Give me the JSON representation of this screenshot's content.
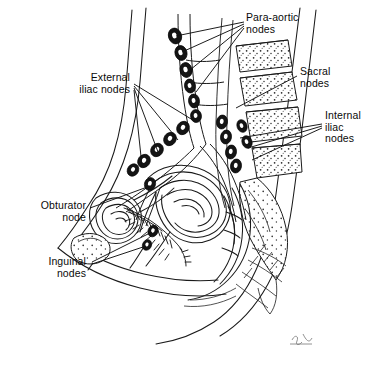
{
  "figure": {
    "type": "anatomical-line-diagram",
    "style": "black-and-white pen-and-ink medical illustration",
    "signature": "ST"
  },
  "labels": [
    {
      "id": "para-aortic",
      "text": "Para-aortic\nnodes",
      "align": "left",
      "x": 246,
      "y": 12,
      "leaders": [
        [
          244,
          22,
          176,
          36
        ],
        [
          244,
          24,
          182,
          52
        ],
        [
          244,
          26,
          190,
          70
        ],
        [
          244,
          28,
          196,
          92
        ]
      ]
    },
    {
      "id": "external-iliac",
      "text": "External\niliac nodes",
      "align": "right",
      "x": 24,
      "y": 72,
      "w": 106,
      "leaders": [
        [
          134,
          84,
          196,
          122
        ],
        [
          134,
          86,
          178,
          140
        ],
        [
          134,
          88,
          158,
          152
        ],
        [
          134,
          90,
          142,
          166
        ]
      ]
    },
    {
      "id": "sacral",
      "text": "Sacral\nnodes",
      "align": "left",
      "x": 300,
      "y": 66,
      "leaders": [
        [
          297,
          76,
          236,
          108
        ]
      ]
    },
    {
      "id": "internal-iliac",
      "text": "Internal\niliac\nnodes",
      "align": "left",
      "x": 325,
      "y": 110,
      "leaders": [
        [
          322,
          124,
          240,
          138
        ],
        [
          322,
          126,
          248,
          148
        ],
        [
          322,
          128,
          252,
          160
        ]
      ]
    },
    {
      "id": "obturator",
      "text": "Obturator\nnode",
      "align": "right",
      "x": 8,
      "y": 200,
      "w": 78,
      "leaders": [
        [
          90,
          208,
          150,
          186
        ]
      ]
    },
    {
      "id": "inguinal",
      "text": "Inguinal\nnodes",
      "align": "right",
      "x": 16,
      "y": 256,
      "w": 70,
      "leaders": [
        [
          92,
          262,
          152,
          232
        ],
        [
          92,
          264,
          146,
          246
        ]
      ]
    }
  ],
  "node_groups": [
    {
      "name": "para-aortic-chain",
      "nodes": [
        {
          "cx": 175,
          "cy": 36,
          "rx": 6.5,
          "ry": 8,
          "rot": -18
        },
        {
          "cx": 181,
          "cy": 53,
          "rx": 6,
          "ry": 7.5,
          "rot": -14
        },
        {
          "cx": 186,
          "cy": 70,
          "rx": 6,
          "ry": 7.5,
          "rot": -12
        },
        {
          "cx": 190,
          "cy": 86,
          "rx": 5.5,
          "ry": 7,
          "rot": -10
        },
        {
          "cx": 194,
          "cy": 101,
          "rx": 5.5,
          "ry": 7,
          "rot": -8
        },
        {
          "cx": 196,
          "cy": 116,
          "rx": 5.5,
          "ry": 6.5,
          "rot": -6
        }
      ]
    },
    {
      "name": "external-iliac-chain",
      "nodes": [
        {
          "cx": 183,
          "cy": 128,
          "rx": 6,
          "ry": 7,
          "rot": 35
        },
        {
          "cx": 170,
          "cy": 139,
          "rx": 6,
          "ry": 7,
          "rot": 35
        },
        {
          "cx": 157,
          "cy": 150,
          "rx": 6,
          "ry": 7,
          "rot": 35
        },
        {
          "cx": 144,
          "cy": 161,
          "rx": 6,
          "ry": 7,
          "rot": 35
        },
        {
          "cx": 133,
          "cy": 170,
          "rx": 5.5,
          "ry": 6.5,
          "rot": 35
        }
      ]
    },
    {
      "name": "internal-iliac-chain",
      "nodes": [
        {
          "cx": 222,
          "cy": 122,
          "rx": 5.5,
          "ry": 7,
          "rot": 10
        },
        {
          "cx": 226,
          "cy": 137,
          "rx": 5.5,
          "ry": 7,
          "rot": 10
        },
        {
          "cx": 231,
          "cy": 152,
          "rx": 5.5,
          "ry": 7,
          "rot": 10
        },
        {
          "cx": 236,
          "cy": 166,
          "rx": 5.5,
          "ry": 7,
          "rot": 10
        }
      ]
    },
    {
      "name": "sacral-internal-lateral",
      "nodes": [
        {
          "cx": 242,
          "cy": 126,
          "rx": 5,
          "ry": 6.5,
          "rot": -20
        },
        {
          "cx": 247,
          "cy": 142,
          "rx": 5,
          "ry": 6.5,
          "rot": -20
        }
      ]
    },
    {
      "name": "obturator-node",
      "nodes": [
        {
          "cx": 150,
          "cy": 184,
          "rx": 5.5,
          "ry": 6.5,
          "rot": 20
        }
      ]
    },
    {
      "name": "inguinal-nodes",
      "nodes": [
        {
          "cx": 153,
          "cy": 231,
          "rx": 5,
          "ry": 6,
          "rot": 25
        },
        {
          "cx": 147,
          "cy": 245,
          "rx": 4.5,
          "ry": 5.5,
          "rot": 25
        }
      ]
    }
  ],
  "colors": {
    "ink": "#111111",
    "line": "#1a1a1a",
    "node_fill": "#141414",
    "node_center": "#ffffff",
    "bone_stipple": "#2a2a2a",
    "background": "#ffffff"
  }
}
